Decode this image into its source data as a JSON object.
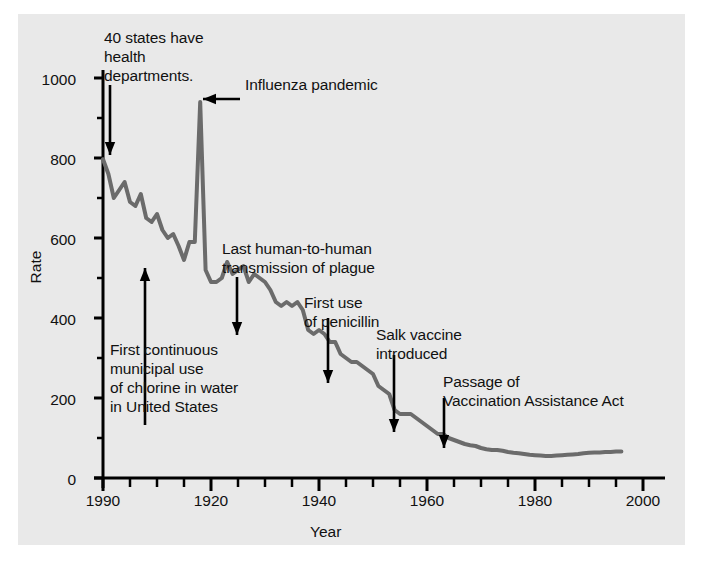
{
  "figure": {
    "background": "#ffffff",
    "panel_color": "#e9e9e9",
    "line_color": "#6b6b6b",
    "axis_color": "#000000",
    "text_color": "#111111"
  },
  "axes": {
    "xlabel": "Year",
    "ylabel": "Rate",
    "x_tick_labels": [
      "1990",
      "1920",
      "1940",
      "1960",
      "1980",
      "2000"
    ],
    "x_tick_values": [
      1900,
      1920,
      1940,
      1960,
      1980,
      2000
    ],
    "y_tick_labels": [
      "0",
      "200",
      "400",
      "600",
      "800",
      "1000"
    ],
    "y_tick_values": [
      0,
      200,
      400,
      600,
      800,
      1000
    ],
    "x_minor_step": 5,
    "y_minor_step": 100
  },
  "annotations": [
    {
      "id": "health-departments",
      "text": "40 states have\nhealth\ndepartments.",
      "left": 104,
      "top": 28
    },
    {
      "id": "influenza-pandemic",
      "text": "Influenza pandemic",
      "left": 245,
      "top": 75
    },
    {
      "id": "plague-transmission",
      "text": "Last human-to-human\ntransmission of plague",
      "left": 222,
      "top": 239
    },
    {
      "id": "penicillin",
      "text": "First use\nof penicillin",
      "left": 304,
      "top": 293
    },
    {
      "id": "salk-vaccine",
      "text": "Salk vaccine\nintroduced",
      "left": 376,
      "top": 325
    },
    {
      "id": "vaccination-act",
      "text": "Passage of\nVaccination Assistance Act",
      "left": 443,
      "top": 372
    },
    {
      "id": "chlorine-water",
      "text": "First continuous\nmunicipal use\nof chlorine in water\nin United States",
      "left": 110,
      "top": 340
    }
  ],
  "chart_data": {
    "type": "line",
    "title": "",
    "xlabel": "Year",
    "ylabel": "Rate",
    "xlim": [
      1900,
      2000
    ],
    "ylim": [
      0,
      1000
    ],
    "grid": false,
    "legend": null,
    "series": [
      {
        "name": "Crude death rate",
        "x": [
          1900,
          1901,
          1902,
          1903,
          1904,
          1905,
          1906,
          1907,
          1908,
          1909,
          1910,
          1911,
          1912,
          1913,
          1914,
          1915,
          1916,
          1917,
          1918,
          1919,
          1920,
          1921,
          1922,
          1923,
          1924,
          1925,
          1926,
          1927,
          1928,
          1929,
          1930,
          1931,
          1932,
          1933,
          1934,
          1935,
          1936,
          1937,
          1938,
          1939,
          1940,
          1941,
          1942,
          1943,
          1944,
          1945,
          1946,
          1947,
          1948,
          1949,
          1950,
          1951,
          1952,
          1953,
          1954,
          1955,
          1956,
          1957,
          1958,
          1959,
          1960,
          1961,
          1962,
          1963,
          1964,
          1965,
          1966,
          1967,
          1968,
          1969,
          1970,
          1971,
          1972,
          1973,
          1974,
          1975,
          1976,
          1977,
          1978,
          1979,
          1980,
          1981,
          1982,
          1983,
          1984,
          1985,
          1986,
          1987,
          1988,
          1989,
          1990,
          1991,
          1992,
          1993,
          1994,
          1995,
          1996
        ],
        "y": [
          797,
          760,
          700,
          720,
          740,
          690,
          680,
          710,
          650,
          640,
          660,
          620,
          600,
          610,
          580,
          545,
          590,
          590,
          940,
          520,
          490,
          490,
          500,
          540,
          510,
          520,
          530,
          490,
          510,
          500,
          490,
          470,
          440,
          430,
          440,
          430,
          440,
          420,
          370,
          360,
          370,
          360,
          340,
          340,
          310,
          300,
          290,
          290,
          280,
          270,
          260,
          230,
          220,
          210,
          170,
          160,
          160,
          160,
          150,
          140,
          130,
          120,
          110,
          110,
          100,
          95,
          90,
          85,
          82,
          80,
          75,
          72,
          70,
          70,
          68,
          65,
          63,
          62,
          60,
          58,
          57,
          56,
          55,
          55,
          56,
          57,
          58,
          59,
          60,
          62,
          63,
          64,
          64,
          65,
          65,
          66,
          66
        ]
      }
    ]
  }
}
